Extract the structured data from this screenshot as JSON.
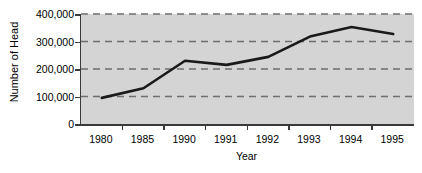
{
  "chart_data": {
    "type": "line",
    "title": "",
    "xlabel": "Year",
    "ylabel": "Number of Head",
    "categories": [
      "1980",
      "1985",
      "1990",
      "1991",
      "1992",
      "1993",
      "1994",
      "1995"
    ],
    "values": [
      95000,
      130000,
      230000,
      215000,
      244000,
      318000,
      353000,
      327000
    ],
    "series": [
      {
        "name": "Number of Head",
        "values": [
          95000,
          130000,
          230000,
          215000,
          244000,
          318000,
          353000,
          327000
        ]
      }
    ],
    "ylim": [
      0,
      400000
    ],
    "ytick_values": [
      0,
      100000,
      200000,
      300000,
      400000
    ],
    "ytick_labels": [
      "0",
      "100,000",
      "200,000",
      "300,000",
      "400,000"
    ],
    "xtick_labels": [
      "1980",
      "1985",
      "1990",
      "1991",
      "1992",
      "1993",
      "1994",
      "1995"
    ],
    "grid": "horizontal-dashed",
    "legend": "none",
    "plot_background": "#d4d4d4",
    "line_color": "#1a1a1a",
    "grid_color": "#6e6e6e",
    "axis_color": "#3a3a3a"
  }
}
